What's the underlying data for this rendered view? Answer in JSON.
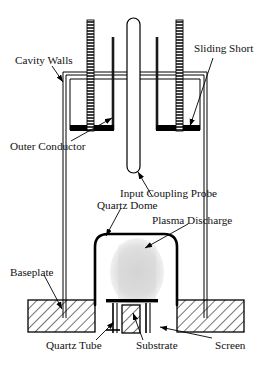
{
  "figure": {
    "type": "technical-line-diagram",
    "width": 277,
    "height": 369,
    "background_color": "#ffffff",
    "line_color": "#000000",
    "fill_colors": {
      "sliding_short": "#000000",
      "hatch": "#000000",
      "plasma_glow": "#d9d9d9",
      "quartz": "#ffffff"
    }
  },
  "labels": {
    "cavity_walls": "Cavity Walls",
    "sliding_short": "Sliding Short",
    "outer_conductor": "Outer Conductor",
    "input_coupling_probe": "Input Coupling Probe",
    "quartz_dome": "Quartz Dome",
    "plasma_discharge": "Plasma Discharge",
    "baseplate": "Baseplate",
    "quartz_tube": "Quartz Tube",
    "substrate": "Substrate",
    "screen": "Screen"
  },
  "components": [
    {
      "name": "cavity-walls",
      "description": "Outer double-line vertical cavity walls enclosing the resonant cavity"
    },
    {
      "name": "outer-conductor",
      "description": "Inner vertical conductor lines inside the cavity"
    },
    {
      "name": "sliding-short-left",
      "description": "Solid black horizontal short bar on the left side"
    },
    {
      "name": "sliding-short-right",
      "description": "Solid black horizontal short bar on the right side"
    },
    {
      "name": "threaded-rod-left",
      "description": "Vertical threaded adjustment rod on the left"
    },
    {
      "name": "threaded-rod-right",
      "description": "Vertical threaded adjustment rod on the right"
    },
    {
      "name": "input-coupling-probe",
      "description": "Central vertical rounded-end coupling probe tube"
    },
    {
      "name": "quartz-dome",
      "description": "Rounded-top quartz bell jar dome over the discharge"
    },
    {
      "name": "plasma-discharge",
      "description": "Soft grey glowing plasma column inside the dome"
    },
    {
      "name": "baseplate-left",
      "description": "Hatched rectangular baseplate block, left"
    },
    {
      "name": "baseplate-right",
      "description": "Hatched rectangular baseplate block, right"
    },
    {
      "name": "screen",
      "description": "Horizontal screen bar across the base opening"
    },
    {
      "name": "substrate",
      "description": "Hatched substrate pedestal column under the screen"
    },
    {
      "name": "quartz-tube",
      "description": "Thin quartz tube lines feeding through the pedestal"
    }
  ]
}
